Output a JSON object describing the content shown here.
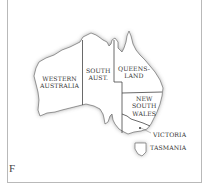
{
  "map": {
    "panel_letter": "F",
    "regions": [
      {
        "name": "western-australia",
        "label": "WESTERN\nAUSTRALIA"
      },
      {
        "name": "south-australia",
        "label": "SOUTH\nAUST."
      },
      {
        "name": "queensland",
        "label": "QUEENS-\nLAND"
      },
      {
        "name": "new-south-wales",
        "label": "NEW\nSOUTH\nWALES"
      },
      {
        "name": "victoria",
        "label": "VICTORIA"
      },
      {
        "name": "tasmania",
        "label": "TASMANIA"
      }
    ],
    "colors": {
      "land": "#ffffff",
      "border": "#444444",
      "coast_shadow": "#9a9a9a",
      "frame": "#b9b9b9"
    }
  }
}
